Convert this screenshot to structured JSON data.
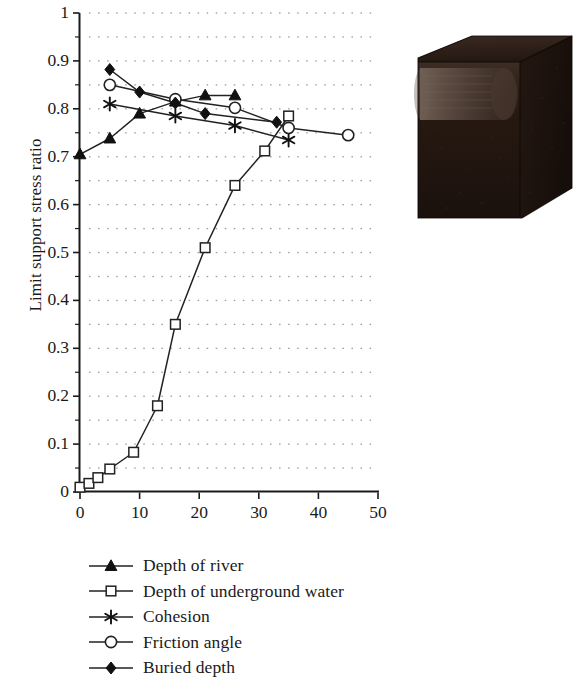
{
  "figure": {
    "y_axis_title": "Limit support stress ratio",
    "x_tick_labels": [
      "0",
      "10",
      "20",
      "30",
      "40",
      "50"
    ],
    "y_tick_labels": [
      "0",
      "0.1",
      "0.2",
      "0.3",
      "0.4",
      "0.5",
      "0.6",
      "0.7",
      "0.8",
      "0.9",
      "1"
    ],
    "photo_caption": "",
    "photo_alt": "dark cubic soil block model with cylindrical tunnel opening"
  },
  "colors": {
    "line": "#222222",
    "marker_fill": "#111111",
    "marker_open": "#ffffff",
    "grid_dot": "#888888",
    "axis": "#1a1a1a",
    "photo_dark": "#2b1d16",
    "photo_darker": "#1d1310",
    "photo_light": "#6b5a50"
  },
  "chart_data": {
    "type": "line",
    "title": "",
    "xlabel": "",
    "ylabel": "Limit support stress ratio",
    "xlim": [
      0,
      50
    ],
    "ylim": [
      0,
      1
    ],
    "xticks": [
      0,
      10,
      20,
      30,
      40,
      50
    ],
    "yticks": [
      0,
      0.1,
      0.2,
      0.3,
      0.4,
      0.5,
      0.6,
      0.7,
      0.8,
      0.9,
      1
    ],
    "grid": "dotted",
    "legend_position": "below",
    "series": [
      {
        "name": "Depth of river",
        "marker": "filled-triangle",
        "x": [
          0,
          5,
          10,
          16,
          21,
          26
        ],
        "y": [
          0.705,
          0.738,
          0.79,
          0.815,
          0.828,
          0.828
        ]
      },
      {
        "name": "Depth of underground water",
        "marker": "open-square",
        "x": [
          0,
          1.5,
          3,
          5,
          9,
          13,
          16,
          21,
          26,
          31,
          35
        ],
        "y": [
          0.01,
          0.018,
          0.03,
          0.048,
          0.083,
          0.18,
          0.35,
          0.51,
          0.64,
          0.712,
          0.785
        ]
      },
      {
        "name": "Cohesion",
        "marker": "asterisk",
        "x": [
          5,
          16,
          26,
          35
        ],
        "y": [
          0.81,
          0.785,
          0.765,
          0.735
        ]
      },
      {
        "name": "Friction angle",
        "marker": "open-circle",
        "x": [
          5,
          16,
          26,
          35,
          45
        ],
        "y": [
          0.85,
          0.82,
          0.802,
          0.76,
          0.745
        ]
      },
      {
        "name": "Buried depth",
        "marker": "filled-diamond",
        "x": [
          5,
          10,
          16,
          21,
          33
        ],
        "y": [
          0.882,
          0.835,
          0.812,
          0.79,
          0.772
        ]
      }
    ]
  }
}
